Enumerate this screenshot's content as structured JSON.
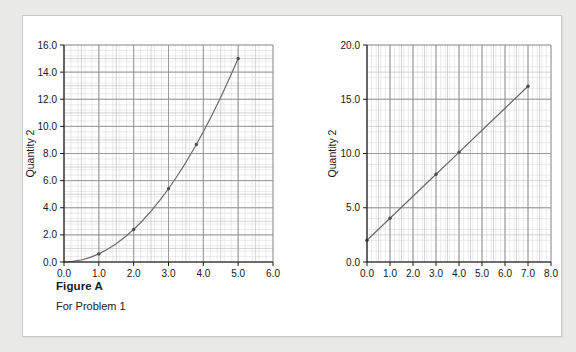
{
  "figure": {
    "caption_title": "Figure A",
    "caption_subtitle": "For Problem 1"
  },
  "chart_data": [
    {
      "id": "left",
      "type": "line",
      "title": "",
      "xlabel": "Quantity 1",
      "ylabel": "Quantity 2",
      "xlim": [
        0.0,
        6.0
      ],
      "ylim": [
        0.0,
        16.0
      ],
      "xticks": [
        "0.0",
        "1.0",
        "2.0",
        "3.0",
        "4.0",
        "5.0",
        "6.0"
      ],
      "xtick_values": [
        0.0,
        1.0,
        2.0,
        3.0,
        4.0,
        5.0,
        6.0
      ],
      "yticks": [
        "0.0",
        "2.0",
        "4.0",
        "6.0",
        "8.0",
        "10.0",
        "12.0",
        "14.0",
        "16.0"
      ],
      "ytick_values": [
        0.0,
        2.0,
        4.0,
        6.0,
        8.0,
        10.0,
        12.0,
        14.0,
        16.0
      ],
      "grid": "graph-paper",
      "legend": "none",
      "line_color": "#6a6a6a",
      "x": [
        0.0,
        0.25,
        0.5,
        0.75,
        1.0,
        1.25,
        1.5,
        1.75,
        2.0,
        2.25,
        2.5,
        2.75,
        3.0,
        3.25,
        3.5,
        3.75,
        4.0,
        4.25,
        4.5,
        4.75,
        5.0
      ],
      "y": [
        0.0,
        0.04,
        0.15,
        0.34,
        0.6,
        0.94,
        1.35,
        1.84,
        2.4,
        3.04,
        3.75,
        4.54,
        5.4,
        6.34,
        7.35,
        8.44,
        9.6,
        10.84,
        12.15,
        13.54,
        15.0
      ],
      "markers": [
        {
          "x": 1.0,
          "y": 0.6
        },
        {
          "x": 2.0,
          "y": 2.4
        },
        {
          "x": 3.0,
          "y": 5.4
        },
        {
          "x": 3.8,
          "y": 8.66
        },
        {
          "x": 5.0,
          "y": 15.0
        }
      ]
    },
    {
      "id": "right",
      "type": "line",
      "title": "",
      "xlabel": "Quantity 1",
      "ylabel": "Quantity 2",
      "xlim": [
        0.0,
        8.0
      ],
      "ylim": [
        0.0,
        20.0
      ],
      "xticks": [
        "0.0",
        "1.0",
        "2.0",
        "3.0",
        "4.0",
        "5.0",
        "6.0",
        "7.0",
        "8.0"
      ],
      "xtick_values": [
        0.0,
        1.0,
        2.0,
        3.0,
        4.0,
        5.0,
        6.0,
        7.0,
        8.0
      ],
      "yticks": [
        "0.0",
        "5.0",
        "10.0",
        "15.0",
        "20.0"
      ],
      "ytick_values": [
        0.0,
        5.0,
        10.0,
        15.0,
        20.0
      ],
      "grid": "graph-paper",
      "legend": "none",
      "line_color": "#6a6a6a",
      "x": [
        0.0,
        1.0,
        2.0,
        3.0,
        4.0,
        5.0,
        6.0,
        7.0
      ],
      "y": [
        2.0,
        4.03,
        6.06,
        8.09,
        10.11,
        12.14,
        14.17,
        16.2
      ],
      "markers": [
        {
          "x": 0.0,
          "y": 2.0
        },
        {
          "x": 1.0,
          "y": 4.03
        },
        {
          "x": 3.0,
          "y": 8.09
        },
        {
          "x": 4.0,
          "y": 10.11
        },
        {
          "x": 7.0,
          "y": 16.2
        }
      ]
    }
  ]
}
